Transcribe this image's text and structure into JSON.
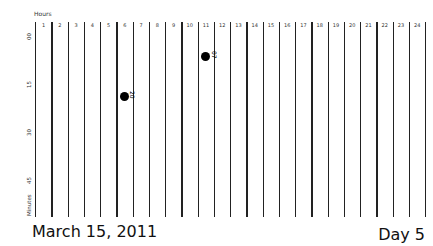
{
  "chart_data": {
    "type": "scatter",
    "title": "",
    "xlabel": "Hours",
    "ylabel": "Minutes",
    "x_ticks": [
      "1",
      "2",
      "3",
      "4",
      "5",
      "6",
      "7",
      "8",
      "9",
      "10",
      "11",
      "12",
      "13",
      "14",
      "15",
      "16",
      "17",
      "18",
      "19",
      "20",
      "21",
      "22",
      "23",
      "24"
    ],
    "y_ticks": [
      "00",
      "15",
      "30",
      "45"
    ],
    "points": [
      {
        "hour": 11,
        "minute": 7,
        "label": "07",
        "y_px": 56
      },
      {
        "hour": 6,
        "minute": 20,
        "label": "20",
        "y_px": 96
      }
    ],
    "grid": "vertical",
    "ylim": [
      0,
      60
    ]
  },
  "footer": {
    "date": "March 15, 2011",
    "day": "Day 5"
  }
}
